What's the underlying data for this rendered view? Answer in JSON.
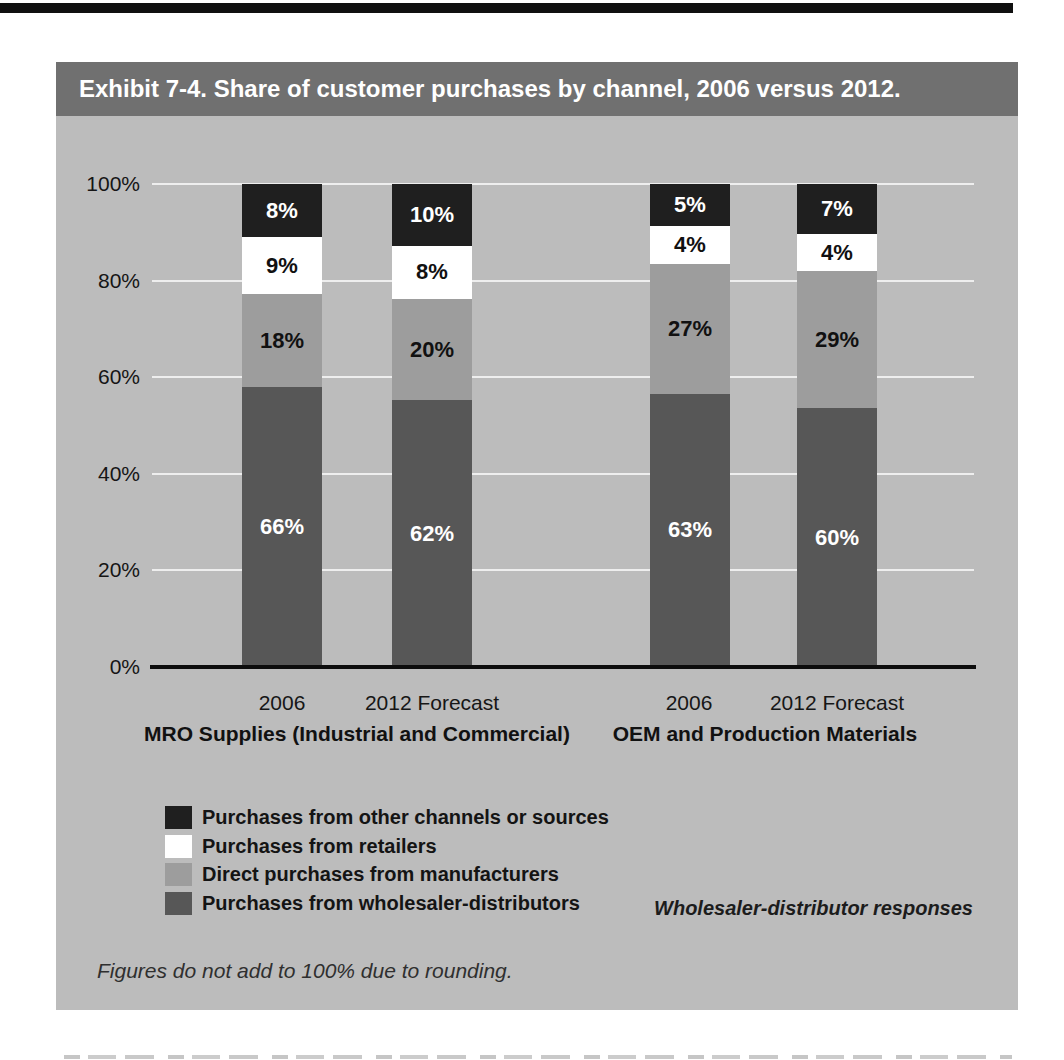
{
  "exhibit": {
    "title": "Exhibit 7-4. Share of customer purchases by channel, 2006 versus 2012.",
    "source_note": "Wholesaler-distributor responses",
    "footnote": "Figures do not add to 100% due to rounding."
  },
  "colors": {
    "panel_bg": "#bcbcbc",
    "title_bar_bg": "#707070",
    "title_text": "#ffffff",
    "gridline": "#eeeeee",
    "axis": "#0d0d0d"
  },
  "chart_data": {
    "type": "bar",
    "stacked": true,
    "value_suffix": "%",
    "ylim": [
      0,
      100
    ],
    "y_ticks": [
      "100%",
      "80%",
      "60%",
      "40%",
      "20%",
      "0%"
    ],
    "grid": true,
    "legend_position": "bottom-left",
    "categories": [
      "2006",
      "2012 Forecast",
      "2006",
      "2012 Forecast"
    ],
    "groups": [
      "MRO Supplies (Industrial and Commercial)",
      "OEM and Production Materials"
    ],
    "series": [
      {
        "name": "Purchases from other channels or sources",
        "color": "#1f1f1f",
        "label_color": "#ffffff",
        "values": [
          8,
          10,
          5,
          7
        ]
      },
      {
        "name": "Purchases from retailers",
        "color": "#ffffff",
        "label_color": "#111111",
        "values": [
          9,
          8,
          4,
          4
        ]
      },
      {
        "name": "Direct purchases from manufacturers",
        "color": "#9d9d9d",
        "label_color": "#111111",
        "values": [
          18,
          20,
          27,
          29
        ]
      },
      {
        "name": "Purchases from wholesaler-distributors",
        "color": "#575757",
        "label_color": "#ffffff",
        "values": [
          66,
          62,
          63,
          60
        ]
      }
    ]
  }
}
